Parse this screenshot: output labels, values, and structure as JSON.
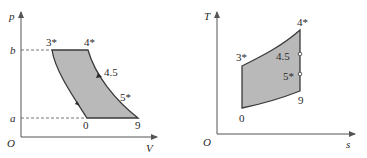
{
  "diagrams": [
    {
      "id": "pv",
      "x_axis_label": "V",
      "y_axis_label": "p",
      "origin_label": "O",
      "pressure_levels": {
        "high": "b",
        "low": "a"
      },
      "points": {
        "p3": "3*",
        "p4": "4*",
        "p45": "4.5",
        "p5": "5*",
        "p9": "9",
        "p0": "0"
      }
    },
    {
      "id": "ts",
      "x_axis_label": "s",
      "y_axis_label": "T",
      "origin_label": "O",
      "points": {
        "p3": "3*",
        "p4": "4*",
        "p45": "4.5",
        "p5": "5*",
        "p9": "9",
        "p0": "0"
      }
    }
  ],
  "colors": {
    "fill": "#b9b9b9",
    "outline": "#3a3a3a",
    "axis": "#555555",
    "dash": "#555555"
  }
}
